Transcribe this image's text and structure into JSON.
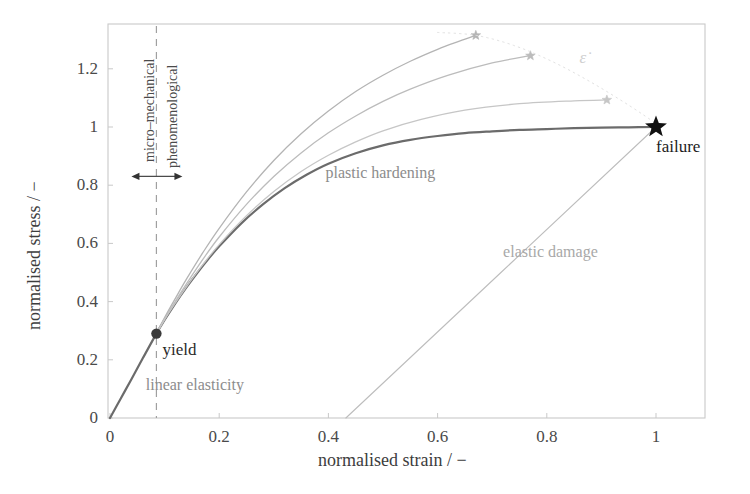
{
  "chart_data": {
    "type": "line",
    "title": "",
    "xlabel": "normalised strain / −",
    "ylabel": "normalised stress / −",
    "xlim": [
      0,
      1.12
    ],
    "ylim": [
      0,
      1.36
    ],
    "xticks": [
      "0",
      "0.2",
      "0.4",
      "0.6",
      "0.8",
      "1"
    ],
    "xtick_values": [
      0,
      0.2,
      0.4,
      0.6,
      0.8,
      1
    ],
    "yticks": [
      "0",
      "0.2",
      "0.4",
      "0.6",
      "0.8",
      "1",
      "1.2"
    ],
    "ytick_values": [
      0,
      0.2,
      0.4,
      0.6,
      0.8,
      1,
      1.2
    ],
    "grid": false,
    "legend": "none",
    "series": [
      {
        "name": "reference stress-strain curve",
        "color": "#6b6b6b",
        "width": 2.2,
        "points": [
          [
            0.0,
            0.0
          ],
          [
            0.02,
            0.068
          ],
          [
            0.04,
            0.136
          ],
          [
            0.06,
            0.205
          ],
          [
            0.085,
            0.29
          ],
          [
            0.1,
            0.337
          ],
          [
            0.12,
            0.395
          ],
          [
            0.14,
            0.449
          ],
          [
            0.16,
            0.499
          ],
          [
            0.18,
            0.546
          ],
          [
            0.2,
            0.59
          ],
          [
            0.24,
            0.668
          ],
          [
            0.28,
            0.734
          ],
          [
            0.32,
            0.79
          ],
          [
            0.36,
            0.836
          ],
          [
            0.4,
            0.874
          ],
          [
            0.45,
            0.91
          ],
          [
            0.5,
            0.937
          ],
          [
            0.55,
            0.956
          ],
          [
            0.6,
            0.969
          ],
          [
            0.65,
            0.979
          ],
          [
            0.7,
            0.985
          ],
          [
            0.75,
            0.99
          ],
          [
            0.8,
            0.993
          ],
          [
            0.85,
            0.996
          ],
          [
            0.9,
            0.998
          ],
          [
            0.95,
            0.999
          ],
          [
            1.0,
            1.0
          ]
        ]
      },
      {
        "name": "strain-rate curve 1",
        "color": "#b4b4b4",
        "width": 1.3,
        "points": [
          [
            0.085,
            0.29
          ],
          [
            0.1,
            0.345
          ],
          [
            0.12,
            0.412
          ],
          [
            0.14,
            0.477
          ],
          [
            0.17,
            0.568
          ],
          [
            0.2,
            0.652
          ],
          [
            0.25,
            0.777
          ],
          [
            0.3,
            0.885
          ],
          [
            0.35,
            0.977
          ],
          [
            0.4,
            1.055
          ],
          [
            0.45,
            1.122
          ],
          [
            0.5,
            1.178
          ],
          [
            0.55,
            1.226
          ],
          [
            0.6,
            1.267
          ],
          [
            0.64,
            1.295
          ],
          [
            0.67,
            1.315
          ]
        ],
        "end_marker": "star",
        "end_point": [
          0.67,
          1.315
        ]
      },
      {
        "name": "strain-rate curve 2",
        "color": "#bcbcbc",
        "width": 1.3,
        "points": [
          [
            0.085,
            0.29
          ],
          [
            0.1,
            0.34
          ],
          [
            0.12,
            0.402
          ],
          [
            0.14,
            0.461
          ],
          [
            0.17,
            0.545
          ],
          [
            0.2,
            0.622
          ],
          [
            0.25,
            0.734
          ],
          [
            0.3,
            0.83
          ],
          [
            0.35,
            0.911
          ],
          [
            0.4,
            0.98
          ],
          [
            0.45,
            1.038
          ],
          [
            0.5,
            1.088
          ],
          [
            0.55,
            1.13
          ],
          [
            0.62,
            1.178
          ],
          [
            0.7,
            1.22
          ],
          [
            0.77,
            1.245
          ]
        ],
        "end_marker": "star",
        "end_point": [
          0.77,
          1.245
        ]
      },
      {
        "name": "strain-rate curve 3",
        "color": "#c6c6c6",
        "width": 1.3,
        "points": [
          [
            0.085,
            0.29
          ],
          [
            0.1,
            0.338
          ],
          [
            0.12,
            0.396
          ],
          [
            0.14,
            0.451
          ],
          [
            0.17,
            0.527
          ],
          [
            0.2,
            0.596
          ],
          [
            0.25,
            0.695
          ],
          [
            0.3,
            0.778
          ],
          [
            0.35,
            0.847
          ],
          [
            0.4,
            0.903
          ],
          [
            0.45,
            0.949
          ],
          [
            0.5,
            0.987
          ],
          [
            0.57,
            1.026
          ],
          [
            0.65,
            1.058
          ],
          [
            0.75,
            1.08
          ],
          [
            0.85,
            1.09
          ],
          [
            0.91,
            1.093
          ]
        ],
        "end_marker": "star",
        "end_point": [
          0.91,
          1.093
        ]
      },
      {
        "name": "strain-rate locus",
        "color": "#e2e2e2",
        "width": 1.0,
        "style": "dotted",
        "points": [
          [
            0.6,
            1.325
          ],
          [
            0.67,
            1.315
          ],
          [
            0.74,
            1.28
          ],
          [
            0.81,
            1.225
          ],
          [
            0.88,
            1.155
          ],
          [
            0.95,
            1.075
          ],
          [
            1.0,
            1.012
          ]
        ]
      },
      {
        "name": "elastic damage unloading",
        "color": "#bdbdbd",
        "width": 1.1,
        "points": [
          [
            1.0,
            1.0
          ],
          [
            0.432,
            0.0
          ]
        ]
      }
    ],
    "markers": [
      {
        "name": "yield",
        "x": 0.085,
        "y": 0.29,
        "shape": "circle",
        "color": "#3a3a3a",
        "label": "yield"
      },
      {
        "name": "failure",
        "x": 1.0,
        "y": 1.0,
        "shape": "star",
        "color": "#111111",
        "label": "failure"
      }
    ],
    "annotations": [
      {
        "name": "yield",
        "text": "yield",
        "x": 0.085,
        "y": 0.29
      },
      {
        "name": "failure",
        "text": "failure",
        "x": 1.0,
        "y": 1.0
      },
      {
        "name": "linear-elasticity",
        "text": "linear elasticity",
        "x": 0.06,
        "y": 0.11
      },
      {
        "name": "plastic-hardening",
        "text": "plastic hardening",
        "x": 0.38,
        "y": 0.86
      },
      {
        "name": "elastic-damage",
        "text": "elastic damage",
        "x": 0.72,
        "y": 0.56
      },
      {
        "name": "strain-rate",
        "text": "ε̇",
        "x": 0.86,
        "y": 1.23
      }
    ],
    "region_divider": {
      "x": 0.085,
      "style": "dashed",
      "color": "#a0a0a0",
      "left_label": "micro–mechanical",
      "right_label": "phenomenological",
      "arrow_y": 0.83
    }
  },
  "axes": {
    "x_title": "normalised strain / −",
    "y_title": "normalised stress / −"
  },
  "labels": {
    "yield": "yield",
    "failure": "failure",
    "linear_elasticity": "linear elasticity",
    "plastic_hardening": "plastic hardening",
    "elastic_damage": "elastic damage",
    "strain_rate": "ε̇",
    "micro_mechanical": "micro–mechanical",
    "phenomenological": "phenomenological"
  },
  "colors": {
    "frame": "#c9c9c9",
    "main_curve": "#6b6b6b",
    "rate_curve": "#bcbcbc",
    "divider": "#a0a0a0",
    "tick_text": "#4a4a4a",
    "marker_dark": "#111111"
  }
}
